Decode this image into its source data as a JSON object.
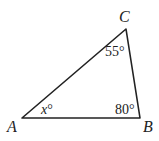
{
  "diagram": {
    "type": "triangle",
    "vertices": {
      "A": {
        "label": "A",
        "x": 22,
        "y": 118
      },
      "B": {
        "label": "B",
        "x": 140,
        "y": 118
      },
      "C": {
        "label": "C",
        "x": 126,
        "y": 29
      }
    },
    "angles": {
      "A": {
        "var": "x",
        "deg": "°"
      },
      "B": {
        "value": "80°"
      },
      "C": {
        "value": "55°"
      }
    },
    "stroke_color": "#222222"
  }
}
